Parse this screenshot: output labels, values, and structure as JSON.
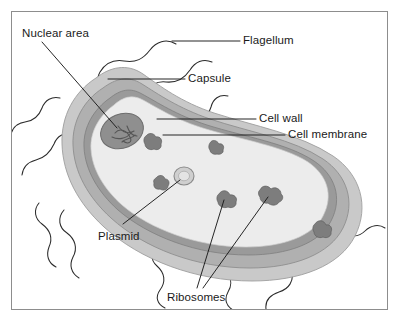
{
  "figure": {
    "frame": {
      "border_color": "#8d8d8d",
      "background": "#ffffff"
    }
  },
  "palette": {
    "capsule": "#c9c9c9",
    "cell_wall": "#b0b0b0",
    "cell_membrane": "#9a9a9a",
    "cytoplasm": "#ececec",
    "nuclear_area": "#8f8f8f",
    "nucleoid_fibers": "#5e5e5e",
    "ribosome": "#7d7d7d",
    "plasmid": "#cfcfcf",
    "flagellum_line": "#2b2b2b",
    "leader_line": "#1a1a1a",
    "label_text": "#1a1a1a"
  },
  "labels": [
    {
      "id": "nuclear-area",
      "text": "Nuclear area",
      "x": 22,
      "y": 28,
      "leader": "diagonal"
    },
    {
      "id": "flagellum",
      "text": "Flagellum",
      "x": 243,
      "y": 35,
      "leader": "horizontal"
    },
    {
      "id": "capsule",
      "text": "Capsule",
      "x": 188,
      "y": 73,
      "leader": "horizontal"
    },
    {
      "id": "cell-wall",
      "text": "Cell wall",
      "x": 259,
      "y": 113,
      "leader": "horizontal"
    },
    {
      "id": "cell-membrane",
      "text": "Cell membrane",
      "x": 288,
      "y": 129,
      "leader": "horizontal"
    },
    {
      "id": "plasmid",
      "text": "Plasmid",
      "x": 98,
      "y": 231,
      "leader": "diagonal"
    },
    {
      "id": "ribosomes",
      "text": "Ribosomes",
      "x": 167,
      "y": 292,
      "leader": "diagonal"
    }
  ],
  "structures": {
    "capsule": {
      "name": "Capsule",
      "description": "Outermost light-gray gelatinous halo surrounding the cell wall"
    },
    "cell_wall": {
      "name": "Cell wall",
      "description": "Medium-gray rigid band beneath the capsule"
    },
    "cell_membrane": {
      "name": "Cell membrane",
      "description": "Thin darker line enclosing the cytoplasm"
    },
    "cytoplasm": {
      "name": "Cytoplasm",
      "description": "Pale interior of the rod-shaped cell"
    },
    "nuclear_area": {
      "name": "Nuclear area",
      "description": "Dark oval nucleoid region containing tangled chromosomal DNA fibers"
    },
    "plasmid": {
      "name": "Plasmid",
      "description": "Small circular DNA loop free in the cytoplasm"
    },
    "ribosomes": {
      "name": "Ribosomes",
      "description": "Small irregular dark granules scattered through the cytoplasm",
      "count": 6
    },
    "flagella": {
      "name": "Flagella",
      "description": "Long wavy whip-like filaments projecting from the cell surface",
      "count": 8
    }
  }
}
